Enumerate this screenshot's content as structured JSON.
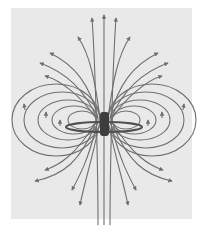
{
  "diagram": {
    "colors": {
      "background": "#ffffff",
      "panel": "#e9e9e9",
      "field_line": "#6e6e6e",
      "loop": "#555555",
      "core": "#3a3a3a"
    },
    "center": [
      99,
      118
    ],
    "field_lines": 22
  }
}
